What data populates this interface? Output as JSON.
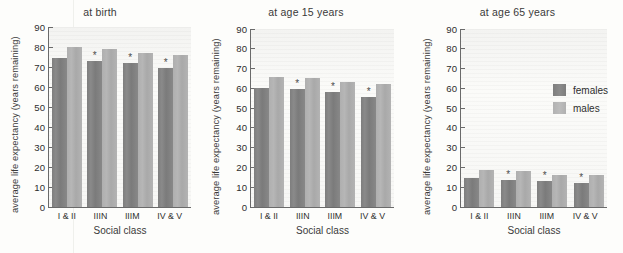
{
  "figure": {
    "xlabel": "Social class",
    "ylabel": "average life expectancy (years remaining)",
    "categories": [
      "I & II",
      "IIIN",
      "IIIM",
      "IV & V"
    ],
    "yticks": [
      "0",
      "10",
      "20",
      "30",
      "40",
      "50",
      "60",
      "70",
      "80",
      "90"
    ],
    "legend": {
      "items": [
        {
          "label": "females",
          "color": "#828282"
        },
        {
          "label": "males",
          "color": "#b3b3b3"
        }
      ]
    }
  },
  "chart_data": [
    {
      "type": "bar",
      "title": "at birth",
      "xlabel": "Social class",
      "ylabel": "average life expectancy (years remaining)",
      "categories": [
        "I & II",
        "IIIN",
        "IIIM",
        "IV & V"
      ],
      "ylim": [
        0,
        90
      ],
      "ytick_step": 10,
      "grid": false,
      "legend_position": "none",
      "series": [
        {
          "name": "females",
          "color": "#828282",
          "values": [
            74.5,
            73.0,
            72.0,
            69.5
          ]
        },
        {
          "name": "males",
          "color": "#b3b3b3",
          "values": [
            80.0,
            79.0,
            77.0,
            76.0
          ]
        }
      ],
      "annotations": [
        {
          "category": "IIIN",
          "series": "females",
          "marker": "*"
        },
        {
          "category": "IIIM",
          "series": "females",
          "marker": "*"
        },
        {
          "category": "IV & V",
          "series": "females",
          "marker": "*"
        }
      ]
    },
    {
      "type": "bar",
      "title": "at age 15 years",
      "xlabel": "Social class",
      "ylabel": "average life expectancy (years remaining)",
      "categories": [
        "I & II",
        "IIIN",
        "IIIM",
        "IV & V"
      ],
      "ylim": [
        0,
        90
      ],
      "ytick_step": 10,
      "grid": false,
      "legend_position": "none",
      "series": [
        {
          "name": "females",
          "color": "#828282",
          "values": [
            60.0,
            59.5,
            58.0,
            55.5
          ]
        },
        {
          "name": "males",
          "color": "#b3b3b3",
          "values": [
            65.5,
            65.0,
            63.0,
            62.0
          ]
        }
      ],
      "annotations": [
        {
          "category": "IIIN",
          "series": "females",
          "marker": "*"
        },
        {
          "category": "IIIM",
          "series": "females",
          "marker": "*"
        },
        {
          "category": "IV & V",
          "series": "females",
          "marker": "*"
        }
      ]
    },
    {
      "type": "bar",
      "title": "at age 65 years",
      "xlabel": "Social class",
      "ylabel": "average life expectancy (years remaining)",
      "categories": [
        "I & II",
        "IIIN",
        "IIIM",
        "IV & V"
      ],
      "ylim": [
        0,
        90
      ],
      "ytick_step": 10,
      "grid": false,
      "legend_position": "upper right",
      "series": [
        {
          "name": "females",
          "color": "#828282",
          "values": [
            14.5,
            13.5,
            13.0,
            12.0
          ]
        },
        {
          "name": "males",
          "color": "#b3b3b3",
          "values": [
            18.5,
            18.0,
            16.0,
            16.0
          ]
        }
      ],
      "annotations": [
        {
          "category": "IIIN",
          "series": "females",
          "marker": "*"
        },
        {
          "category": "IIIM",
          "series": "females",
          "marker": "*"
        },
        {
          "category": "IV & V",
          "series": "females",
          "marker": "*"
        }
      ]
    }
  ]
}
